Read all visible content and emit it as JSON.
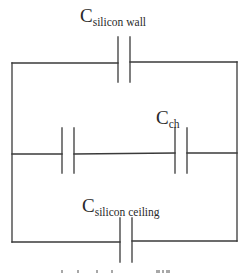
{
  "diagram": {
    "type": "circuit-schematic",
    "colors": {
      "wire": "#3a3a3a",
      "text": "#2a2a2a",
      "background": "#ffffff"
    },
    "components": [
      {
        "id": "c_wall",
        "kind": "capacitor",
        "label_main": "C",
        "label_sub": "silicon wall",
        "branch": "top"
      },
      {
        "id": "c_left_mid",
        "kind": "capacitor",
        "label_main": "",
        "label_sub": "",
        "branch": "middle"
      },
      {
        "id": "c_ch",
        "kind": "capacitor",
        "label_main": "C",
        "label_sub": "ch",
        "branch": "middle"
      },
      {
        "id": "c_ceiling",
        "kind": "capacitor",
        "label_main": "C",
        "label_sub": "silicon ceiling",
        "branch": "bottom"
      }
    ],
    "topology": "Three parallel branches between left and right rails: top branch with C_silicon_wall, middle branch with two capacitors in series (unlabeled and C_ch), bottom branch with C_silicon_ceiling.",
    "caption_clipped": "(clipped caption text at bottom edge)"
  }
}
